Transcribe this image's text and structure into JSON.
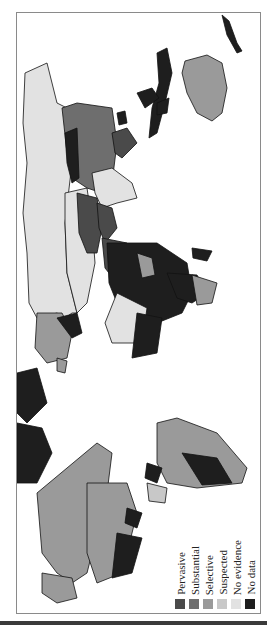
{
  "map": {
    "title": "World map of degrees of state involvement by country",
    "orientation": "rotated 90° clockwise",
    "categories": [
      {
        "label": "Pervasive",
        "color": "#4a4a4a"
      },
      {
        "label": "Substantial",
        "color": "#6e6e6e"
      },
      {
        "label": "Selective",
        "color": "#9a9a9a"
      },
      {
        "label": "Suspected",
        "color": "#c8c8c8"
      },
      {
        "label": "No evidence",
        "color": "#e2e2e2"
      },
      {
        "label": "No data",
        "color": "#1e1e1e"
      }
    ]
  },
  "legend": {
    "items": [
      {
        "label": "Pervasive",
        "color": "#4a4a4a"
      },
      {
        "label": "Substantial",
        "color": "#6e6e6e"
      },
      {
        "label": "Selective",
        "color": "#9a9a9a"
      },
      {
        "label": "Suspected",
        "color": "#c8c8c8"
      },
      {
        "label": "No evidence",
        "color": "#e2e2e2"
      },
      {
        "label": "No data",
        "color": "#1e1e1e"
      }
    ]
  },
  "colors": {
    "frame": "#8a8a8a",
    "ocean": "#ffffff",
    "outline": "#111111"
  }
}
